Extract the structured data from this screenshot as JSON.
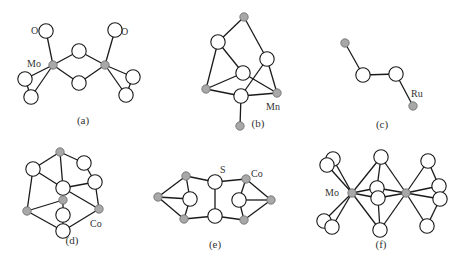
{
  "figure": {
    "colors": {
      "metal_atom": "#a8a8a8",
      "open_atom": "#ffffff",
      "bond": "#1a1a1a",
      "text": "#333333"
    },
    "panels": [
      {
        "id": "a",
        "caption": "(a)",
        "caption_pos": [
          83,
          124
        ],
        "labels": [
          {
            "text": "O",
            "x": 31,
            "y": 34
          },
          {
            "text": "Mo",
            "x": 27,
            "y": 67
          },
          {
            "text": "O",
            "x": 121,
            "y": 35
          }
        ],
        "atoms": [
          {
            "type": "metal",
            "x": 53,
            "y": 65
          },
          {
            "type": "metal",
            "x": 105,
            "y": 65
          },
          {
            "type": "open",
            "x": 46,
            "y": 31
          },
          {
            "type": "open",
            "x": 115,
            "y": 30
          },
          {
            "type": "open",
            "x": 79,
            "y": 51
          },
          {
            "type": "open",
            "x": 79,
            "y": 83
          },
          {
            "type": "open",
            "x": 25,
            "y": 79
          },
          {
            "type": "open",
            "x": 31,
            "y": 97
          },
          {
            "type": "open",
            "x": 133,
            "y": 77
          },
          {
            "type": "open",
            "x": 126,
            "y": 95
          }
        ],
        "bonds": [
          [
            0,
            2
          ],
          [
            1,
            3
          ],
          [
            0,
            4
          ],
          [
            4,
            1
          ],
          [
            0,
            5
          ],
          [
            5,
            1
          ],
          [
            0,
            6
          ],
          [
            0,
            7
          ],
          [
            6,
            7
          ],
          [
            1,
            8
          ],
          [
            1,
            9
          ],
          [
            8,
            9
          ]
        ]
      },
      {
        "id": "b",
        "caption": "(b)",
        "caption_pos": [
          258,
          127
        ],
        "labels": [
          {
            "text": "Mn",
            "x": 266,
            "y": 110
          }
        ],
        "atoms": [
          {
            "type": "metal",
            "x": 244,
            "y": 17
          },
          {
            "type": "open",
            "x": 218,
            "y": 42
          },
          {
            "type": "open",
            "x": 267,
            "y": 59
          },
          {
            "type": "open",
            "x": 243,
            "y": 73
          },
          {
            "type": "metal",
            "x": 206,
            "y": 89
          },
          {
            "type": "metal",
            "x": 277,
            "y": 93
          },
          {
            "type": "open",
            "x": 241,
            "y": 96
          },
          {
            "type": "metal",
            "x": 240,
            "y": 126
          }
        ],
        "bonds": [
          [
            0,
            1
          ],
          [
            0,
            2
          ],
          [
            1,
            4
          ],
          [
            1,
            3
          ],
          [
            3,
            5
          ],
          [
            3,
            4
          ],
          [
            2,
            5
          ],
          [
            2,
            6
          ],
          [
            4,
            6
          ],
          [
            6,
            5
          ],
          [
            6,
            7
          ]
        ]
      },
      {
        "id": "c",
        "caption": "(c)",
        "caption_pos": [
          382,
          128
        ],
        "labels": [
          {
            "text": "Ru",
            "x": 411,
            "y": 97
          }
        ],
        "atoms": [
          {
            "type": "metal",
            "x": 345,
            "y": 43
          },
          {
            "type": "open",
            "x": 363,
            "y": 75
          },
          {
            "type": "open",
            "x": 396,
            "y": 74
          },
          {
            "type": "metal",
            "x": 413,
            "y": 106
          }
        ],
        "bonds": [
          [
            0,
            1
          ],
          [
            1,
            2
          ],
          [
            2,
            3
          ]
        ]
      },
      {
        "id": "d",
        "caption": "(d)",
        "caption_pos": [
          72,
          244
        ],
        "labels": [
          {
            "text": "Co",
            "x": 90,
            "y": 227
          }
        ],
        "atoms": [
          {
            "type": "metal",
            "x": 60,
            "y": 152
          },
          {
            "type": "open",
            "x": 33,
            "y": 169
          },
          {
            "type": "open",
            "x": 84,
            "y": 163
          },
          {
            "type": "open",
            "x": 95,
            "y": 182
          },
          {
            "type": "open",
            "x": 63,
            "y": 188
          },
          {
            "type": "metal",
            "x": 63,
            "y": 200
          },
          {
            "type": "open",
            "x": 63,
            "y": 215
          },
          {
            "type": "metal",
            "x": 27,
            "y": 211
          },
          {
            "type": "metal",
            "x": 99,
            "y": 209
          },
          {
            "type": "open",
            "x": 63,
            "y": 231
          }
        ],
        "bonds": [
          [
            0,
            1
          ],
          [
            0,
            2
          ],
          [
            2,
            3
          ],
          [
            0,
            4
          ],
          [
            1,
            7
          ],
          [
            1,
            4
          ],
          [
            4,
            8
          ],
          [
            3,
            8
          ],
          [
            3,
            4
          ],
          [
            7,
            5
          ],
          [
            4,
            5
          ],
          [
            5,
            6
          ],
          [
            6,
            9
          ],
          [
            7,
            9
          ],
          [
            8,
            9
          ]
        ]
      },
      {
        "id": "e",
        "caption": "(e)",
        "caption_pos": [
          215,
          248
        ],
        "labels": [
          {
            "text": "S",
            "x": 220,
            "y": 173
          },
          {
            "text": "Co",
            "x": 251,
            "y": 177
          }
        ],
        "atoms": [
          {
            "type": "metal",
            "x": 158,
            "y": 197
          },
          {
            "type": "metal",
            "x": 186,
            "y": 176
          },
          {
            "type": "open",
            "x": 190,
            "y": 199
          },
          {
            "type": "metal",
            "x": 184,
            "y": 219
          },
          {
            "type": "open",
            "x": 215,
            "y": 182
          },
          {
            "type": "open",
            "x": 215,
            "y": 216
          },
          {
            "type": "metal",
            "x": 246,
            "y": 179
          },
          {
            "type": "open",
            "x": 239,
            "y": 200
          },
          {
            "type": "metal",
            "x": 244,
            "y": 220
          },
          {
            "type": "metal",
            "x": 271,
            "y": 200
          }
        ],
        "bonds": [
          [
            0,
            1
          ],
          [
            0,
            2
          ],
          [
            0,
            3
          ],
          [
            1,
            2
          ],
          [
            2,
            3
          ],
          [
            1,
            4
          ],
          [
            3,
            5
          ],
          [
            4,
            5
          ],
          [
            4,
            6
          ],
          [
            5,
            8
          ],
          [
            6,
            7
          ],
          [
            7,
            8
          ],
          [
            6,
            9
          ],
          [
            7,
            9
          ],
          [
            8,
            9
          ]
        ]
      },
      {
        "id": "f",
        "caption": "(f)",
        "caption_pos": [
          381,
          248
        ],
        "labels": [
          {
            "text": "Mo",
            "x": 325,
            "y": 196
          }
        ],
        "atoms": [
          {
            "type": "metal",
            "x": 352,
            "y": 193
          },
          {
            "type": "metal",
            "x": 406,
            "y": 193
          },
          {
            "type": "open",
            "x": 333,
            "y": 159
          },
          {
            "type": "open",
            "x": 327,
            "y": 165
          },
          {
            "type": "open",
            "x": 324,
            "y": 221
          },
          {
            "type": "open",
            "x": 332,
            "y": 227
          },
          {
            "type": "open",
            "x": 381,
            "y": 157
          },
          {
            "type": "open",
            "x": 377,
            "y": 188
          },
          {
            "type": "open",
            "x": 378,
            "y": 198
          },
          {
            "type": "open",
            "x": 380,
            "y": 230
          },
          {
            "type": "open",
            "x": 428,
            "y": 161
          },
          {
            "type": "open",
            "x": 439,
            "y": 186
          },
          {
            "type": "open",
            "x": 440,
            "y": 199
          },
          {
            "type": "open",
            "x": 427,
            "y": 226
          }
        ],
        "bonds": [
          [
            0,
            2
          ],
          [
            0,
            3
          ],
          [
            0,
            4
          ],
          [
            0,
            5
          ],
          [
            0,
            6
          ],
          [
            0,
            7
          ],
          [
            0,
            8
          ],
          [
            0,
            9
          ],
          [
            1,
            6
          ],
          [
            1,
            7
          ],
          [
            1,
            8
          ],
          [
            1,
            9
          ],
          [
            6,
            7
          ],
          [
            8,
            9
          ],
          [
            1,
            10
          ],
          [
            1,
            11
          ],
          [
            1,
            12
          ],
          [
            1,
            13
          ],
          [
            10,
            11
          ],
          [
            12,
            13
          ]
        ]
      }
    ]
  }
}
